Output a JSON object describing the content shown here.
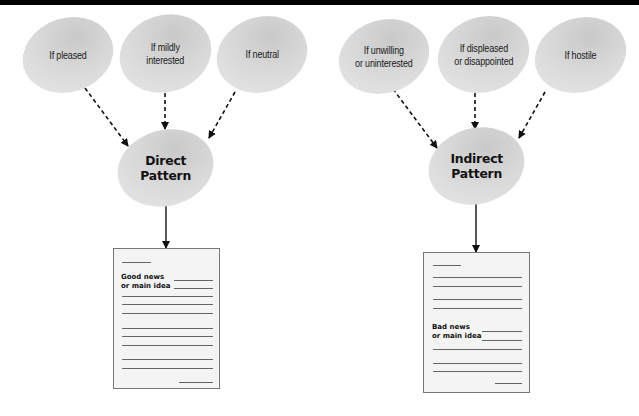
{
  "diagram": {
    "direct": {
      "conditions": [
        {
          "label": "If pleased"
        },
        {
          "label": "If mildly\ninterested"
        },
        {
          "label": "If neutral"
        }
      ],
      "pattern_label": "Direct\nPattern",
      "document": {
        "heading_label": "Good news\nor main idea"
      }
    },
    "indirect": {
      "conditions": [
        {
          "label": "If unwilling\nor uninterested"
        },
        {
          "label": "If displeased\nor disappointed"
        },
        {
          "label": "If hostile"
        }
      ],
      "pattern_label": "Indirect\nPattern",
      "document": {
        "heading_label": "Bad news\nor main idea"
      }
    }
  },
  "colors": {
    "ellipse_fill": "#d8d8d8",
    "arrow": "#111111",
    "document_fill": "#f4f4f4",
    "top_bar": "#000000"
  }
}
